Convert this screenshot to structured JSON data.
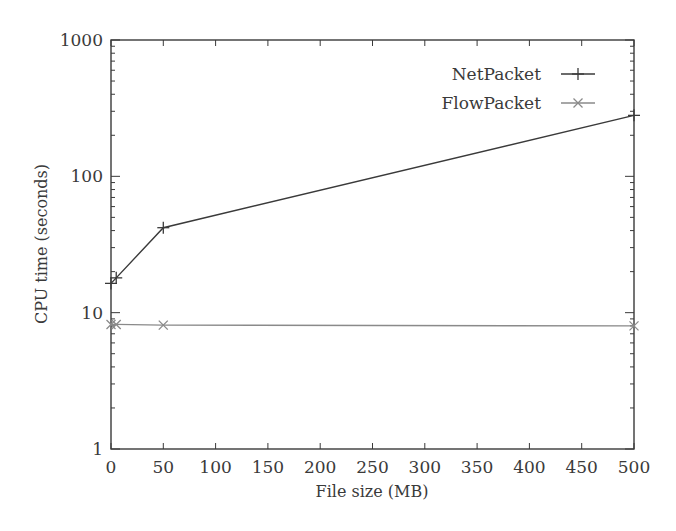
{
  "chart_data": {
    "type": "line",
    "title": "",
    "xlabel": "File size (MB)",
    "ylabel": "CPU time (seconds)",
    "xlim": [
      0,
      500
    ],
    "ylim": [
      1,
      1000
    ],
    "yscale": "log",
    "grid": false,
    "legend_position": "upper right",
    "x_ticks": [
      "0",
      "50",
      "100",
      "150",
      "200",
      "250",
      "300",
      "350",
      "400",
      "450",
      "500"
    ],
    "y_ticks": [
      "1",
      "10",
      "100",
      "1000"
    ],
    "series": [
      {
        "name": "NetPacket",
        "marker": "+",
        "color": "#3a3a3a",
        "x": [
          0,
          5,
          50,
          500
        ],
        "values": [
          16.4,
          18,
          42,
          280
        ]
      },
      {
        "name": "FlowPacket",
        "marker": "x",
        "color": "#8a8a8a",
        "x": [
          0,
          5,
          50,
          500
        ],
        "values": [
          8.2,
          8.2,
          8.1,
          8.0
        ]
      }
    ]
  },
  "legend": {
    "items": [
      {
        "label": "NetPacket"
      },
      {
        "label": "FlowPacket"
      }
    ]
  }
}
